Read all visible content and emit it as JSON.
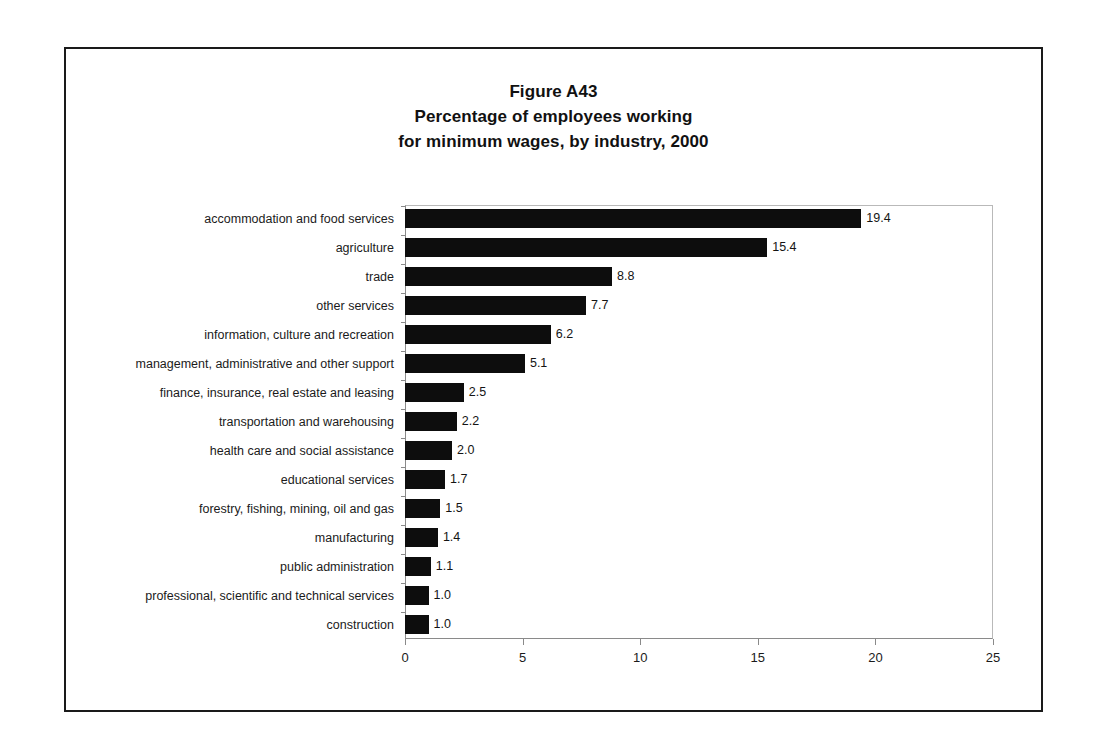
{
  "figure": {
    "title_lines": [
      "Figure A43",
      "Percentage of employees working",
      "for minimum wages, by industry, 2000"
    ]
  },
  "chart_data": {
    "type": "bar",
    "orientation": "horizontal",
    "title": "Figure A43 Percentage of employees working for minimum wages, by industry, 2000",
    "xlabel": "",
    "ylabel": "",
    "xlim": [
      0,
      25
    ],
    "xticks": [
      0,
      5,
      10,
      15,
      20,
      25
    ],
    "grid": false,
    "legend": null,
    "bar_color": "#0d0d0d",
    "categories": [
      "accommodation and food services",
      "agriculture",
      "trade",
      "other services",
      "information, culture and recreation",
      "management, administrative and other support",
      "finance, insurance, real estate and leasing",
      "transportation and warehousing",
      "health care and social assistance",
      "educational services",
      "forestry, fishing, mining, oil and gas",
      "manufacturing",
      "public administration",
      "professional, scientific and technical services",
      "construction"
    ],
    "values": [
      19.4,
      15.4,
      8.8,
      7.7,
      6.2,
      5.1,
      2.5,
      2.2,
      2.0,
      1.7,
      1.5,
      1.4,
      1.1,
      1.0,
      1.0
    ],
    "value_labels": [
      "19.4",
      "15.4",
      "8.8",
      "7.7",
      "6.2",
      "5.1",
      "2.5",
      "2.2",
      "2.0",
      "1.7",
      "1.5",
      "1.4",
      "1.1",
      "1.0",
      "1.0"
    ],
    "xtick_labels": [
      "0",
      "5",
      "10",
      "15",
      "20",
      "25"
    ]
  }
}
